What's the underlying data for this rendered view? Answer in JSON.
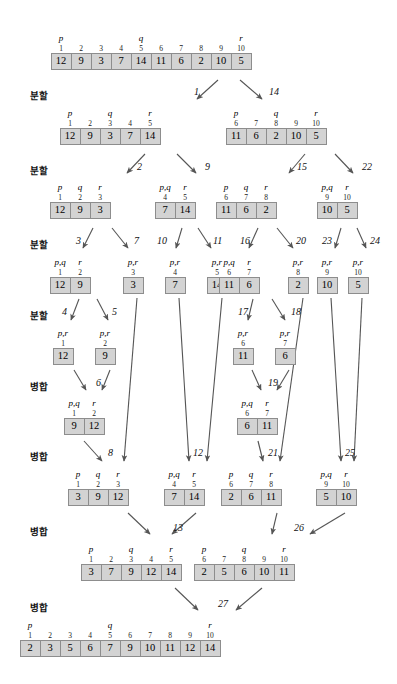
{
  "diagram": {
    "array_cell_color": "#d3d3d3",
    "array_border_color": "#8d8d8d",
    "arrow_color": "#555555"
  },
  "stage_labels": [
    {
      "text": "분할",
      "x": 30,
      "y": 88
    },
    {
      "text": "분할",
      "x": 30,
      "y": 163
    },
    {
      "text": "분할",
      "x": 30,
      "y": 237
    },
    {
      "text": "분할",
      "x": 30,
      "y": 308
    },
    {
      "text": "병합",
      "x": 30,
      "y": 379
    },
    {
      "text": "병합",
      "x": 30,
      "y": 449
    },
    {
      "text": "병합",
      "x": 30,
      "y": 524
    },
    {
      "text": "병합",
      "x": 30,
      "y": 600
    }
  ],
  "arrays": [
    {
      "id": "root",
      "x": 151,
      "y": 53,
      "values": [
        12,
        9,
        3,
        7,
        14,
        11,
        6,
        2,
        10,
        5
      ],
      "indices": [
        1,
        2,
        3,
        4,
        5,
        6,
        7,
        8,
        9,
        10
      ],
      "pointers": [
        {
          "label": "p",
          "slot": 0
        },
        {
          "label": "q",
          "slot": 4
        },
        {
          "label": "r",
          "slot": 9
        }
      ]
    },
    {
      "id": "d1L",
      "x": 110,
      "y": 128,
      "values": [
        12,
        9,
        3,
        7,
        14
      ],
      "indices": [
        1,
        2,
        3,
        4,
        5
      ],
      "pointers": [
        {
          "label": "p",
          "slot": 0
        },
        {
          "label": "q",
          "slot": 2
        },
        {
          "label": "r",
          "slot": 4
        }
      ]
    },
    {
      "id": "d1R",
      "x": 276,
      "y": 128,
      "values": [
        11,
        6,
        2,
        10,
        5
      ],
      "indices": [
        6,
        7,
        8,
        9,
        10
      ],
      "pointers": [
        {
          "label": "p",
          "slot": 0
        },
        {
          "label": "q",
          "slot": 2
        },
        {
          "label": "r",
          "slot": 4
        }
      ]
    },
    {
      "id": "d2a",
      "x": 80,
      "y": 202,
      "values": [
        12,
        9,
        3
      ],
      "indices": [
        1,
        2,
        3
      ],
      "pointers": [
        {
          "label": "p",
          "slot": 0
        },
        {
          "label": "q",
          "slot": 1
        },
        {
          "label": "r",
          "slot": 2
        }
      ]
    },
    {
      "id": "d2b",
      "x": 175,
      "y": 202,
      "values": [
        7,
        14
      ],
      "indices": [
        4,
        5
      ],
      "pointers": [
        {
          "label": "p,q",
          "slot": 0
        },
        {
          "label": "r",
          "slot": 1
        }
      ]
    },
    {
      "id": "d2c",
      "x": 246,
      "y": 202,
      "values": [
        11,
        6,
        2
      ],
      "indices": [
        6,
        7,
        8
      ],
      "pointers": [
        {
          "label": "p",
          "slot": 0
        },
        {
          "label": "q",
          "slot": 1
        },
        {
          "label": "r",
          "slot": 2
        }
      ]
    },
    {
      "id": "d2d",
      "x": 337,
      "y": 202,
      "values": [
        10,
        5
      ],
      "indices": [
        9,
        10
      ],
      "pointers": [
        {
          "label": "p,q",
          "slot": 0
        },
        {
          "label": "r",
          "slot": 1
        }
      ]
    },
    {
      "id": "d3a",
      "x": 70,
      "y": 277,
      "values": [
        12,
        9
      ],
      "indices": [
        1,
        2
      ],
      "pointers": [
        {
          "label": "p,q",
          "slot": 0
        },
        {
          "label": "r",
          "slot": 1
        }
      ]
    },
    {
      "id": "d3b",
      "x": 133,
      "y": 277,
      "values": [
        3
      ],
      "indices": [
        3
      ],
      "pointers": [
        {
          "label": "p,r",
          "slot": 0
        }
      ]
    },
    {
      "id": "d3c",
      "x": 175,
      "y": 277,
      "values": [
        7
      ],
      "indices": [
        4
      ],
      "pointers": [
        {
          "label": "p,r",
          "slot": 0
        }
      ]
    },
    {
      "id": "d3d",
      "x": 217,
      "y": 277,
      "values": [
        14
      ],
      "indices": [
        5
      ],
      "pointers": [
        {
          "label": "p,r",
          "slot": 0
        }
      ]
    },
    {
      "id": "d3e",
      "x": 239,
      "y": 277,
      "values": [
        11,
        6
      ],
      "indices": [
        6,
        7
      ],
      "pointers": [
        {
          "label": "p,q",
          "slot": 0
        },
        {
          "label": "r",
          "slot": 1
        }
      ]
    },
    {
      "id": "d3f",
      "x": 298,
      "y": 277,
      "values": [
        2
      ],
      "indices": [
        8
      ],
      "pointers": [
        {
          "label": "p,r",
          "slot": 0
        }
      ]
    },
    {
      "id": "d3g",
      "x": 327,
      "y": 277,
      "values": [
        10
      ],
      "indices": [
        9
      ],
      "pointers": [
        {
          "label": "p,r",
          "slot": 0
        }
      ]
    },
    {
      "id": "d3h",
      "x": 358,
      "y": 277,
      "values": [
        5
      ],
      "indices": [
        10
      ],
      "pointers": [
        {
          "label": "p,r",
          "slot": 0
        }
      ]
    },
    {
      "id": "d4a",
      "x": 63,
      "y": 348,
      "values": [
        12
      ],
      "indices": [
        1
      ],
      "pointers": [
        {
          "label": "p,r",
          "slot": 0
        }
      ]
    },
    {
      "id": "d4b",
      "x": 105,
      "y": 348,
      "values": [
        9
      ],
      "indices": [
        2
      ],
      "pointers": [
        {
          "label": "p,r",
          "slot": 0
        }
      ]
    },
    {
      "id": "d4c",
      "x": 243,
      "y": 348,
      "values": [
        11
      ],
      "indices": [
        6
      ],
      "pointers": [
        {
          "label": "p,r",
          "slot": 0
        }
      ]
    },
    {
      "id": "d4d",
      "x": 285,
      "y": 348,
      "values": [
        6
      ],
      "indices": [
        7
      ],
      "pointers": [
        {
          "label": "p,r",
          "slot": 0
        }
      ]
    },
    {
      "id": "m1a",
      "x": 84,
      "y": 418,
      "values": [
        9,
        12
      ],
      "indices": [
        1,
        2
      ],
      "pointers": [
        {
          "label": "p,q",
          "slot": 0
        },
        {
          "label": "r",
          "slot": 1
        }
      ]
    },
    {
      "id": "m1b",
      "x": 257,
      "y": 418,
      "values": [
        6,
        11
      ],
      "indices": [
        6,
        7
      ],
      "pointers": [
        {
          "label": "p,q",
          "slot": 0
        },
        {
          "label": "r",
          "slot": 1
        }
      ]
    },
    {
      "id": "m2a",
      "x": 98,
      "y": 489,
      "values": [
        3,
        9,
        12
      ],
      "indices": [
        1,
        2,
        3
      ],
      "pointers": [
        {
          "label": "p",
          "slot": 0
        },
        {
          "label": "q",
          "slot": 1
        },
        {
          "label": "r",
          "slot": 2
        }
      ]
    },
    {
      "id": "m2b",
      "x": 184,
      "y": 489,
      "values": [
        7,
        14
      ],
      "indices": [
        4,
        5
      ],
      "pointers": [
        {
          "label": "p,q",
          "slot": 0
        },
        {
          "label": "r",
          "slot": 1
        }
      ]
    },
    {
      "id": "m2c",
      "x": 251,
      "y": 489,
      "values": [
        2,
        6,
        11
      ],
      "indices": [
        6,
        7,
        8
      ],
      "pointers": [
        {
          "label": "p",
          "slot": 0
        },
        {
          "label": "q",
          "slot": 1
        },
        {
          "label": "r",
          "slot": 2
        }
      ]
    },
    {
      "id": "m2d",
      "x": 336,
      "y": 489,
      "values": [
        5,
        10
      ],
      "indices": [
        9,
        10
      ],
      "pointers": [
        {
          "label": "p,q",
          "slot": 0
        },
        {
          "label": "r",
          "slot": 1
        }
      ]
    },
    {
      "id": "m3a",
      "x": 131,
      "y": 564,
      "values": [
        3,
        7,
        9,
        12,
        14
      ],
      "indices": [
        1,
        2,
        3,
        4,
        5
      ],
      "pointers": [
        {
          "label": "p",
          "slot": 0
        },
        {
          "label": "q",
          "slot": 2
        },
        {
          "label": "r",
          "slot": 4
        }
      ]
    },
    {
      "id": "m3b",
      "x": 244,
      "y": 564,
      "values": [
        2,
        5,
        6,
        10,
        11
      ],
      "indices": [
        6,
        7,
        8,
        9,
        10
      ],
      "pointers": [
        {
          "label": "p",
          "slot": 0
        },
        {
          "label": "q",
          "slot": 2
        },
        {
          "label": "r",
          "slot": 4
        }
      ]
    },
    {
      "id": "final",
      "x": 120,
      "y": 640,
      "values": [
        2,
        3,
        5,
        6,
        7,
        9,
        10,
        11,
        12,
        14
      ],
      "indices": [
        1,
        2,
        3,
        4,
        5,
        6,
        7,
        8,
        9,
        10
      ],
      "pointers": [
        {
          "label": "p",
          "slot": 0
        },
        {
          "label": "q",
          "slot": 4
        },
        {
          "label": "r",
          "slot": 9
        }
      ]
    }
  ],
  "steps": [
    {
      "n": "1",
      "x": 194,
      "y": 86
    },
    {
      "n": "14",
      "x": 269,
      "y": 86
    },
    {
      "n": "2",
      "x": 137,
      "y": 161
    },
    {
      "n": "9",
      "x": 205,
      "y": 161
    },
    {
      "n": "15",
      "x": 297,
      "y": 161
    },
    {
      "n": "22",
      "x": 362,
      "y": 161
    },
    {
      "n": "3",
      "x": 76,
      "y": 235
    },
    {
      "n": "7",
      "x": 134,
      "y": 235
    },
    {
      "n": "10",
      "x": 157,
      "y": 235
    },
    {
      "n": "11",
      "x": 213,
      "y": 235
    },
    {
      "n": "16",
      "x": 240,
      "y": 235
    },
    {
      "n": "20",
      "x": 296,
      "y": 235
    },
    {
      "n": "23",
      "x": 322,
      "y": 235
    },
    {
      "n": "24",
      "x": 370,
      "y": 235
    },
    {
      "n": "4",
      "x": 62,
      "y": 306
    },
    {
      "n": "5",
      "x": 112,
      "y": 306
    },
    {
      "n": "17",
      "x": 238,
      "y": 306
    },
    {
      "n": "18",
      "x": 291,
      "y": 306
    },
    {
      "n": "6",
      "x": 96,
      "y": 377
    },
    {
      "n": "19",
      "x": 268,
      "y": 377
    },
    {
      "n": "8",
      "x": 108,
      "y": 447
    },
    {
      "n": "12",
      "x": 193,
      "y": 447
    },
    {
      "n": "21",
      "x": 268,
      "y": 447
    },
    {
      "n": "25",
      "x": 345,
      "y": 447
    },
    {
      "n": "13",
      "x": 173,
      "y": 522
    },
    {
      "n": "26",
      "x": 294,
      "y": 522
    },
    {
      "n": "27",
      "x": 218,
      "y": 598
    }
  ],
  "arrows": [
    {
      "x1": 218,
      "y1": 80,
      "x2": 197,
      "y2": 99
    },
    {
      "x1": 240,
      "y1": 80,
      "x2": 262,
      "y2": 99
    },
    {
      "x1": 145,
      "y1": 154,
      "x2": 127,
      "y2": 173
    },
    {
      "x1": 177,
      "y1": 154,
      "x2": 196,
      "y2": 173
    },
    {
      "x1": 305,
      "y1": 154,
      "x2": 289,
      "y2": 173
    },
    {
      "x1": 335,
      "y1": 154,
      "x2": 353,
      "y2": 173
    },
    {
      "x1": 93,
      "y1": 228,
      "x2": 83,
      "y2": 248
    },
    {
      "x1": 112,
      "y1": 228,
      "x2": 128,
      "y2": 248
    },
    {
      "x1": 182,
      "y1": 228,
      "x2": 176,
      "y2": 248
    },
    {
      "x1": 198,
      "y1": 228,
      "x2": 211,
      "y2": 248
    },
    {
      "x1": 258,
      "y1": 228,
      "x2": 249,
      "y2": 248
    },
    {
      "x1": 277,
      "y1": 228,
      "x2": 293,
      "y2": 248
    },
    {
      "x1": 341,
      "y1": 228,
      "x2": 335,
      "y2": 248
    },
    {
      "x1": 357,
      "y1": 228,
      "x2": 366,
      "y2": 248
    },
    {
      "x1": 79,
      "y1": 299,
      "x2": 71,
      "y2": 320
    },
    {
      "x1": 97,
      "y1": 299,
      "x2": 108,
      "y2": 320
    },
    {
      "x1": 253,
      "y1": 299,
      "x2": 248,
      "y2": 320
    },
    {
      "x1": 272,
      "y1": 299,
      "x2": 285,
      "y2": 320
    },
    {
      "x1": 74,
      "y1": 370,
      "x2": 86,
      "y2": 390
    },
    {
      "x1": 110,
      "y1": 370,
      "x2": 102,
      "y2": 390
    },
    {
      "x1": 252,
      "y1": 370,
      "x2": 261,
      "y2": 390
    },
    {
      "x1": 289,
      "y1": 370,
      "x2": 277,
      "y2": 390
    },
    {
      "x1": 84,
      "y1": 441,
      "x2": 102,
      "y2": 461
    },
    {
      "x1": 137,
      "y1": 298,
      "x2": 124,
      "y2": 461
    },
    {
      "x1": 179,
      "y1": 298,
      "x2": 189,
      "y2": 461
    },
    {
      "x1": 222,
      "y1": 298,
      "x2": 207,
      "y2": 461
    },
    {
      "x1": 258,
      "y1": 441,
      "x2": 263,
      "y2": 461
    },
    {
      "x1": 303,
      "y1": 298,
      "x2": 280,
      "y2": 461
    },
    {
      "x1": 331,
      "y1": 298,
      "x2": 341,
      "y2": 461
    },
    {
      "x1": 362,
      "y1": 298,
      "x2": 354,
      "y2": 461
    },
    {
      "x1": 128,
      "y1": 513,
      "x2": 150,
      "y2": 534
    },
    {
      "x1": 196,
      "y1": 513,
      "x2": 172,
      "y2": 534
    },
    {
      "x1": 277,
      "y1": 513,
      "x2": 272,
      "y2": 534
    },
    {
      "x1": 345,
      "y1": 513,
      "x2": 310,
      "y2": 534
    },
    {
      "x1": 175,
      "y1": 588,
      "x2": 198,
      "y2": 610
    },
    {
      "x1": 262,
      "y1": 588,
      "x2": 236,
      "y2": 610
    }
  ]
}
